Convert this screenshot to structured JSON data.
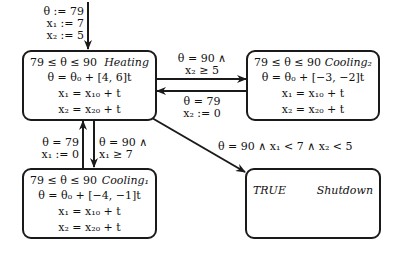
{
  "initial": {
    "lines": [
      "θ := 79",
      "x₁ := 7",
      "x₂ := 5"
    ]
  },
  "modes": {
    "heating": {
      "name": "Heating",
      "invariant": "79 ≤ θ ≤ 90",
      "flows": [
        "θ = θ₀ + [4, 6]t",
        "x₁ = x₁₀ + t",
        "x₂ = x₂₀ + t"
      ]
    },
    "cooling2": {
      "name": "Cooling₂",
      "invariant": "79 ≤ θ ≤ 90",
      "flows": [
        "θ = θ₀ + [−3, −2]t",
        "x₁ = x₁₀ + t",
        "x₂ = x₂₀ + t"
      ]
    },
    "cooling1": {
      "name": "Cooling₁",
      "invariant": "79 ≤ θ ≤ 90",
      "flows": [
        "θ = θ₀ + [−4, −1]t",
        "x₁ = x₁₀ + t",
        "x₂ = x₂₀ + t"
      ]
    },
    "shutdown": {
      "name": "Shutdown",
      "invariant": "TRUE",
      "flows": []
    }
  },
  "transitions": {
    "heating_to_cooling2": {
      "lines": [
        "θ = 90 ∧",
        "x₂ ≥ 5"
      ]
    },
    "cooling2_to_heating": {
      "lines": [
        "θ = 79",
        "x₂ := 0"
      ]
    },
    "cooling1_to_heating": {
      "lines": [
        "θ = 79",
        "x₁ := 0"
      ]
    },
    "heating_to_cooling1": {
      "lines": [
        "θ = 90 ∧",
        "x₁ ≥ 7"
      ]
    },
    "heating_to_shutdown": {
      "lines": [
        "θ = 90 ∧ x₁ < 7 ∧ x₂ < 5"
      ]
    }
  }
}
